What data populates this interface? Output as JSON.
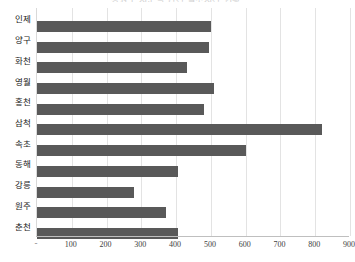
{
  "chart_data": {
    "type": "bar",
    "orientation": "horizontal",
    "title": "강원도 시군별 연간 일조시간 현황",
    "categories": [
      "인제",
      "양구",
      "화천",
      "영월",
      "홍천",
      "삼척",
      "속초",
      "동해",
      "강릉",
      "원주",
      "춘천"
    ],
    "values": [
      500,
      495,
      430,
      510,
      480,
      820,
      600,
      405,
      280,
      370,
      405
    ],
    "xlabel": "",
    "ylabel": "",
    "xlim": [
      0,
      900
    ],
    "xticks": [
      "-",
      "100",
      "200",
      "300",
      "400",
      "500",
      "600",
      "700",
      "800",
      "900"
    ],
    "xtick_values": [
      0,
      100,
      200,
      300,
      400,
      500,
      600,
      700,
      800,
      900
    ],
    "grid": true,
    "legend": false,
    "series_color": "#595959",
    "gridline_color": "#e3e3e3",
    "axis_color": "#bfbfbf"
  }
}
